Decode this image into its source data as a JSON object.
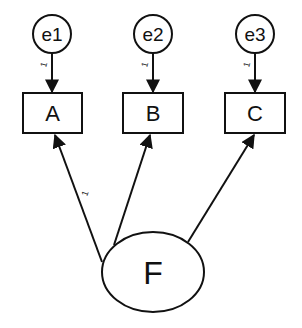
{
  "diagram": {
    "type": "structural-equation-model",
    "error_terms": [
      {
        "id": "e1",
        "label": "e1",
        "cx": 52,
        "cy": 34,
        "r": 19
      },
      {
        "id": "e2",
        "label": "e2",
        "cx": 153,
        "cy": 34,
        "r": 19
      },
      {
        "id": "e3",
        "label": "e3",
        "cx": 255,
        "cy": 34,
        "r": 19
      }
    ],
    "observed": [
      {
        "id": "A",
        "label": "A",
        "x": 23,
        "y": 93,
        "w": 59,
        "h": 40
      },
      {
        "id": "B",
        "label": "B",
        "x": 123,
        "y": 93,
        "w": 60,
        "h": 40
      },
      {
        "id": "C",
        "label": "C",
        "x": 225,
        "y": 93,
        "w": 60,
        "h": 40
      }
    ],
    "latent": {
      "id": "F",
      "label": "F",
      "cx": 153,
      "cy": 272,
      "rx": 51,
      "ry": 40
    },
    "paths": [
      {
        "from": "e1",
        "to": "A",
        "label": "1"
      },
      {
        "from": "e2",
        "to": "B",
        "label": "1"
      },
      {
        "from": "e3",
        "to": "C",
        "label": "1"
      },
      {
        "from": "F",
        "to": "A",
        "label": "1"
      },
      {
        "from": "F",
        "to": "B",
        "label": ""
      },
      {
        "from": "F",
        "to": "C",
        "label": ""
      }
    ],
    "stroke_color": "#111111"
  }
}
